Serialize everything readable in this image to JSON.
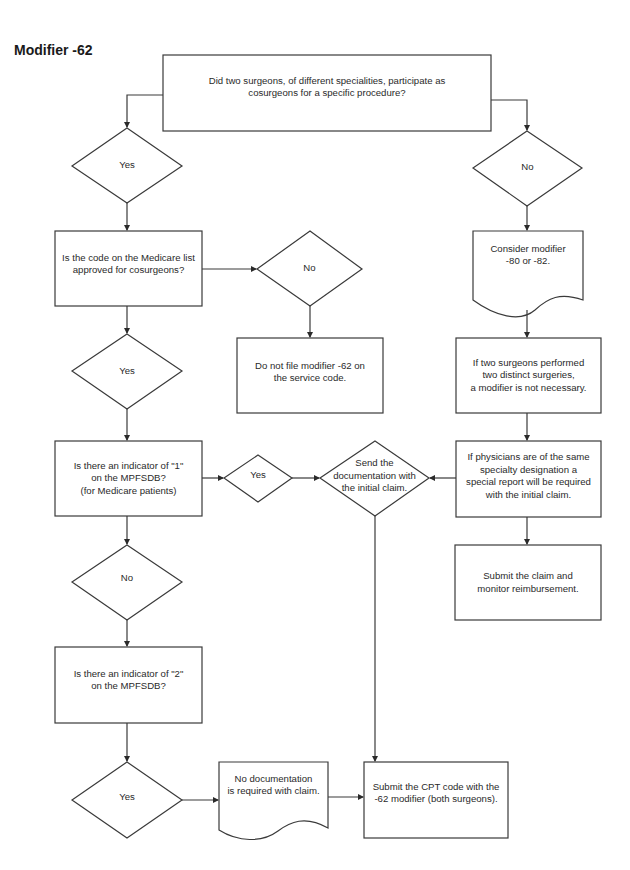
{
  "title": "Modifier -62",
  "nodes": {
    "q_two_surgeons": "Did two surgeons, of different specialities, participate as\ncosurgeons for a specific procedure?",
    "yes_1": "Yes",
    "no_1": "No",
    "q_medicare_list": "Is the code on the Medicare list\napproved for cosurgeons?",
    "no_2": "No",
    "do_not_file": "Do not file modifier -62 on\nthe service code.",
    "consider_modifier": "Consider modifier\n-80 or -82.",
    "yes_2": "Yes",
    "distinct_surgeries": "If two surgeons performed\ntwo distinct surgeries,\na modifier is not necessary.",
    "q_indicator_1": "Is there an indicator of \"1\"\non the MPFSDB?\n(for Medicare patients)",
    "yes_3": "Yes",
    "send_documentation": "Send the\ndocumentation with\nthe initial claim.",
    "same_specialty": "If physicians are of the same\nspecialty designation a\nspecial report will be required\nwith the initial claim.",
    "submit_monitor": "Submit the claim and\nmonitor reimbursement.",
    "no_3": "No",
    "q_indicator_2": "Is there an indicator of \"2\"\non the MPFSDB?",
    "yes_4": "Yes",
    "no_documentation": "No documentation\nis required with claim.",
    "submit_cpt": "Submit the CPT code with the\n-62 modifier (both surgeons)."
  },
  "colors": {
    "stroke": "#3a3a3a",
    "text": "#2a2a2a",
    "background": "#ffffff"
  }
}
